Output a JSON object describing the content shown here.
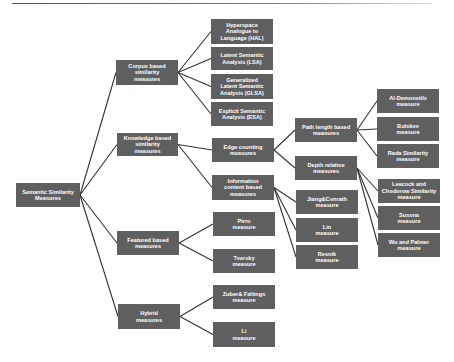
{
  "diagram": {
    "root": {
      "id": "root",
      "label": "Semantic Similarity\nMeasures",
      "box": [
        16,
        183,
        64,
        24
      ]
    },
    "level1": [
      {
        "id": "corpus",
        "label": "Corpus based\nsimilarity\nmeasures",
        "box": [
          116,
          60,
          62,
          25
        ],
        "parent": "root"
      },
      {
        "id": "knowledge",
        "label": "Knowledge based\nsimilarity\nmeasures",
        "box": [
          117,
          133,
          61,
          23
        ],
        "parent": "root"
      },
      {
        "id": "featured",
        "label": "Featured based\nmeasures",
        "box": [
          117,
          231,
          62,
          24
        ],
        "parent": "root"
      },
      {
        "id": "hybrid",
        "label": "Hybrid\nmeasures",
        "box": [
          118,
          304,
          62,
          25
        ],
        "parent": "root"
      }
    ],
    "level2": [
      {
        "id": "hal",
        "label": "Hyperspace\nAnalogue to\nLanguage (HAL)",
        "box": [
          211,
          19,
          62,
          25
        ],
        "parent": "corpus"
      },
      {
        "id": "lsa",
        "label": "Latent Semantic\nAnalysis (LSA)",
        "box": [
          211,
          47,
          62,
          23
        ],
        "parent": "corpus"
      },
      {
        "id": "glsa",
        "label": "Generalized\nLatent Semantic\nAnalysis (GLSA)",
        "box": [
          211,
          74,
          62,
          25
        ],
        "parent": "corpus"
      },
      {
        "id": "esa",
        "label": "Explicit Semantic\nAnalysis (ESA)",
        "box": [
          211,
          102,
          62,
          24
        ],
        "parent": "corpus"
      },
      {
        "id": "edge",
        "label": "Edge counting\nmeasures",
        "box": [
          212,
          138,
          62,
          24
        ],
        "parent": "knowledge"
      },
      {
        "id": "info",
        "label": "Information\ncontent based\nmeasures",
        "box": [
          212,
          175,
          62,
          25
        ],
        "parent": "knowledge"
      },
      {
        "id": "pirro",
        "label": "Pirro\nmeasure",
        "box": [
          213,
          212,
          62,
          24
        ],
        "parent": "featured"
      },
      {
        "id": "tversky",
        "label": "Tversky\nmeasure",
        "box": [
          213,
          249,
          62,
          24
        ],
        "parent": "featured"
      },
      {
        "id": "zuber",
        "label": "Zuber& Faltings\nmeasure",
        "box": [
          213,
          285,
          62,
          24
        ],
        "parent": "hybrid"
      },
      {
        "id": "li",
        "label": "Li\nmeasure",
        "box": [
          213,
          322,
          62,
          25
        ],
        "parent": "hybrid"
      }
    ],
    "level3": [
      {
        "id": "path",
        "label": "Path length based\nmeasures",
        "box": [
          295,
          118,
          62,
          24
        ],
        "parent": "edge"
      },
      {
        "id": "depth",
        "label": "Depth relative\nmeasures",
        "box": [
          295,
          156,
          62,
          24
        ],
        "parent": "edge"
      },
      {
        "id": "jiang",
        "label": "Jiang&Conrath\nmeasure",
        "box": [
          296,
          190,
          62,
          24
        ],
        "parent": "info"
      },
      {
        "id": "lin",
        "label": "Lin\nmeasure",
        "box": [
          296,
          218,
          62,
          24
        ],
        "parent": "info"
      },
      {
        "id": "resnik",
        "label": "Resnik\nmeasure",
        "box": [
          296,
          245,
          62,
          24
        ],
        "parent": "info"
      }
    ],
    "level4": [
      {
        "id": "aldemonstils",
        "label": "Al-Demonstils\nmeasure",
        "box": [
          377,
          89,
          62,
          24
        ],
        "parent": "path"
      },
      {
        "id": "bulskov",
        "label": "Bulskov\nmeasure",
        "box": [
          377,
          117,
          62,
          24
        ],
        "parent": "path"
      },
      {
        "id": "rada",
        "label": "Rada Similarity\nmeasure",
        "box": [
          377,
          144,
          62,
          24
        ],
        "parent": "path"
      },
      {
        "id": "leacock",
        "label": "Leacock and\nChodorow Similarity\nmeasure",
        "box": [
          378,
          179,
          62,
          24
        ],
        "parent": "depth"
      },
      {
        "id": "sussna",
        "label": "Sussna\nmeasure",
        "box": [
          378,
          206,
          62,
          24
        ],
        "parent": "depth"
      },
      {
        "id": "wupalmer",
        "label": "Wu and Palmer\nmeasure",
        "box": [
          378,
          233,
          62,
          24
        ],
        "parent": "depth"
      }
    ],
    "colors": {
      "node_fill": "#5f5f5f",
      "node_text": "#ffffff",
      "edge": "#333333",
      "background": "#ffffff"
    }
  }
}
